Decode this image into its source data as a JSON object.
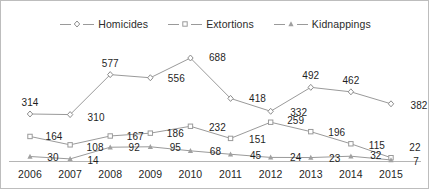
{
  "chart_data": {
    "type": "line",
    "title": "",
    "subtitle": "",
    "xlabel": "",
    "ylabel": "",
    "grid": false,
    "legend_position": "top-center",
    "axis_visible": {
      "x": true,
      "y": false
    },
    "ylim": [
      0,
      760
    ],
    "categories": [
      "2006",
      "2007",
      "2008",
      "2009",
      "2010",
      "2011",
      "2012",
      "2013",
      "2014",
      "2015"
    ],
    "series": [
      {
        "name": "Homicides",
        "marker": "diamond",
        "color": "#8d8d8d",
        "values": [
          314,
          310,
          577,
          556,
          688,
          418,
          332,
          492,
          462,
          382
        ]
      },
      {
        "name": "Extortions",
        "marker": "square",
        "color": "#9a9a9a",
        "values": [
          164,
          108,
          167,
          186,
          232,
          151,
          259,
          196,
          115,
          22
        ]
      },
      {
        "name": "Kidnappings",
        "marker": "triangle",
        "color": "#a0a0a0",
        "values": [
          30,
          14,
          92,
          95,
          68,
          45,
          24,
          23,
          32,
          7
        ]
      }
    ]
  },
  "legend": {
    "items": [
      {
        "label": "Homicides",
        "marker": "diamond"
      },
      {
        "label": "Extortions",
        "marker": "square"
      },
      {
        "label": "Kidnappings",
        "marker": "triangle"
      }
    ]
  },
  "colors": {
    "line": "#9a9a9a",
    "marker": "#8d8d8d",
    "text": "#1f1f1f",
    "axis": "#b5b5b5",
    "border": "#bdbdbd",
    "background": "#ffffff"
  },
  "label_offsets": {
    "Homicides": [
      [
        0,
        -12
      ],
      [
        26,
        2
      ],
      [
        0,
        -12
      ],
      [
        26,
        0
      ],
      [
        27,
        -1
      ],
      [
        27,
        0
      ],
      [
        28,
        1
      ],
      [
        0,
        -12
      ],
      [
        0,
        -12
      ],
      [
        28,
        1
      ]
    ],
    "Extortions": [
      [
        24,
        0
      ],
      [
        25,
        2
      ],
      [
        25,
        0
      ],
      [
        25,
        0
      ],
      [
        27,
        1
      ],
      [
        27,
        1
      ],
      [
        25,
        -2
      ],
      [
        26,
        0
      ],
      [
        26,
        1
      ],
      [
        24,
        -11
      ]
    ],
    "Kidnappings": [
      [
        23,
        0
      ],
      [
        23,
        1
      ],
      [
        24,
        0
      ],
      [
        25,
        0
      ],
      [
        25,
        0
      ],
      [
        25,
        1
      ],
      [
        25,
        0
      ],
      [
        24,
        0
      ],
      [
        25,
        -1
      ],
      [
        25,
        1
      ]
    ]
  }
}
